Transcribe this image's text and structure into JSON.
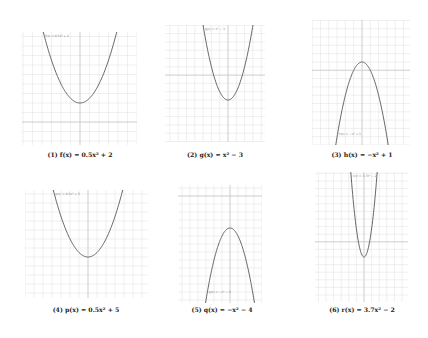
{
  "chart_data": [
    {
      "type": "line",
      "index": 1,
      "caption": "(1) f(x) = 0.5x² + 2",
      "function": "f(x) = 0.5x^2 + 2",
      "a": 0.5,
      "k": 2,
      "h": 0,
      "curve_label": "f(x) = 0.5x² + 2",
      "box": {
        "x": 22,
        "y": 32,
        "w": 115,
        "h": 113
      },
      "vertex_px": {
        "x": 80,
        "y": 103
      },
      "px_per_unit": 9.5,
      "caption_pos": {
        "x": 80,
        "y": 155
      },
      "grid": true
    },
    {
      "type": "line",
      "index": 2,
      "caption": "(2) g(x) = x² − 3",
      "function": "g(x) = x^2 - 3",
      "a": 1,
      "k": -3,
      "h": 0,
      "curve_label": "g(x) = x² − 3",
      "box": {
        "x": 165,
        "y": 25,
        "w": 100,
        "h": 117
      },
      "vertex_px": {
        "x": 228,
        "y": 100
      },
      "px_per_unit": 8.3,
      "caption_pos": {
        "x": 215,
        "y": 155
      },
      "grid": true
    },
    {
      "type": "line",
      "index": 3,
      "caption": "(3) h(x) = −x² + 1",
      "function": "h(x) = -x^2 + 1",
      "a": -1,
      "k": 1,
      "h": 0,
      "curve_label": "h(x) = −x² + 1",
      "box": {
        "x": 312,
        "y": 20,
        "w": 98,
        "h": 125
      },
      "vertex_px": {
        "x": 362,
        "y": 62
      },
      "px_per_unit": 8.3,
      "caption_pos": {
        "x": 362,
        "y": 155
      },
      "grid": true
    },
    {
      "type": "line",
      "index": 4,
      "caption": "(4) p(x) = 0.5x² + 5",
      "function": "p(x) = 0.5x^2 + 5",
      "a": 0.5,
      "k": 5,
      "h": 0,
      "curve_label": "p(x) = 0.5x² + 5",
      "box": {
        "x": 25,
        "y": 190,
        "w": 123,
        "h": 108
      },
      "vertex_px": {
        "x": 88,
        "y": 257
      },
      "px_per_unit": 9.0,
      "caption_pos": {
        "x": 86,
        "y": 310
      },
      "grid": true
    },
    {
      "type": "line",
      "index": 5,
      "caption": "(5) q(x) = −x² − 4",
      "function": "q(x) = -x^2 - 4",
      "a": -1,
      "k": -4,
      "h": 0,
      "curve_label": "q(x) = −x² − 4",
      "box": {
        "x": 178,
        "y": 185,
        "w": 84,
        "h": 118
      },
      "vertex_px": {
        "x": 230,
        "y": 228
      },
      "px_per_unit": 8.0,
      "caption_pos": {
        "x": 222,
        "y": 310
      },
      "grid": true
    },
    {
      "type": "line",
      "index": 6,
      "caption": "(6) r(x) = 3.7x² − 2",
      "function": "r(x) = 3.7x^2 - 2",
      "a": 3.7,
      "k": -2,
      "h": 0,
      "curve_label": "r(x) = 3.7x² − 2",
      "box": {
        "x": 315,
        "y": 172,
        "w": 93,
        "h": 130
      },
      "vertex_px": {
        "x": 364,
        "y": 257
      },
      "px_per_unit": 7.6,
      "caption_pos": {
        "x": 362,
        "y": 310
      },
      "grid": true
    }
  ],
  "colors": {
    "background": "#ffffff",
    "grid": "#e4e4e4",
    "axis": "#cccccc",
    "curve": "#555555",
    "caption": "#222222"
  }
}
